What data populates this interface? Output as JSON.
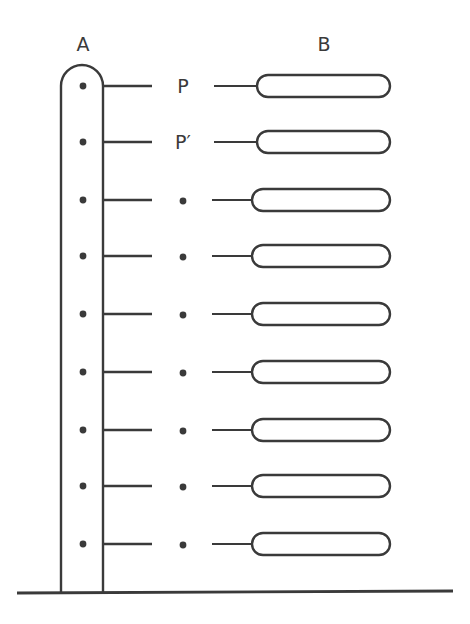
{
  "diagram": {
    "column_labels": {
      "a": "A",
      "b": "B"
    },
    "row_labels": [
      "P",
      "P′",
      "•",
      "•",
      "•",
      "•",
      "•",
      "•",
      "•"
    ],
    "row_count": 9,
    "row_y": [
      86,
      142,
      200,
      256,
      314,
      372,
      430,
      486,
      544
    ],
    "colors": {
      "stroke": "#3a3a3a",
      "background": "#ffffff"
    }
  }
}
